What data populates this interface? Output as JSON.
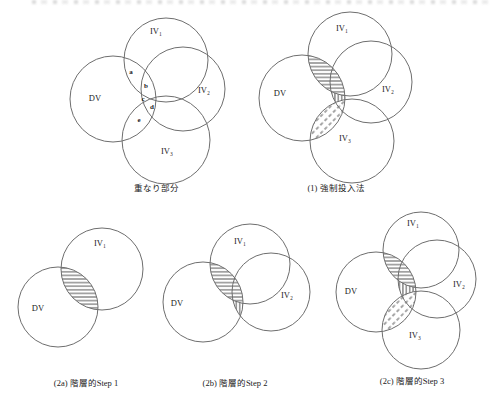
{
  "figure": {
    "colors": {
      "line": "#6e6e6e",
      "hatch": "#3a3a3a",
      "text": "#222222",
      "background": "#ffffff"
    },
    "diagrams": {
      "overlap": {
        "caption": "重なり部分",
        "labels": {
          "dv": "DV",
          "iv1": "IV₁",
          "iv2": "IV₂",
          "iv3": "IV₃"
        },
        "regions": {
          "a": "a",
          "b": "b",
          "c": "c",
          "d": "d",
          "e": "e"
        }
      },
      "forced_entry": {
        "caption": "(1) 強制投入法",
        "labels": {
          "dv": "DV",
          "iv1": "IV₁",
          "iv2": "IV₂",
          "iv3": "IV₃"
        }
      },
      "step1": {
        "caption": "(2a) 階層的Step 1",
        "labels": {
          "dv": "DV",
          "iv1": "IV₁"
        }
      },
      "step2": {
        "caption": "(2b) 階層的Step 2",
        "labels": {
          "dv": "DV",
          "iv1": "IV₁",
          "iv2": "IV₂"
        }
      },
      "step3": {
        "caption": "(2c) 階層的Step 3",
        "labels": {
          "dv": "DV",
          "iv1": "IV₁",
          "iv2": "IV₂",
          "iv3": "IV₃"
        }
      }
    }
  }
}
